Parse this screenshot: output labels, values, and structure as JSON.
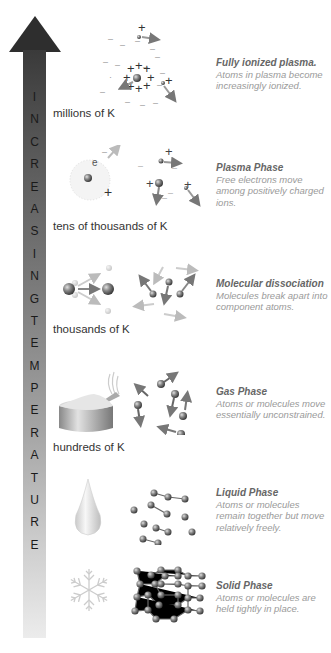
{
  "arrow": {
    "label_letters": [
      "I",
      "N",
      "C",
      "R",
      "E",
      "A",
      "S",
      "I",
      "N",
      "G",
      "T",
      "E",
      "M",
      "P",
      "E",
      "R",
      "A",
      "T",
      "U",
      "R",
      "E"
    ],
    "label": "INCREASING TEMPERATURE",
    "color_top": "#2e2e2e",
    "color_bottom": "#ececec"
  },
  "phases": [
    {
      "name": "fully-ionized-plasma",
      "temperature": "millions of K",
      "title": "Fully ionized plasma.",
      "description": "Atoms in plasma become increasingly ionized."
    },
    {
      "name": "plasma-phase",
      "temperature": "tens of thousands of K",
      "title": "Plasma Phase",
      "description": "Free electrons move among positively charged ions.",
      "electron_label": "e"
    },
    {
      "name": "molecular-dissociation",
      "temperature": "thousands of K",
      "title": "Molecular dissociation",
      "description": "Molecules break apart into component atoms."
    },
    {
      "name": "gas-phase",
      "temperature": "hundreds of K",
      "title": "Gas Phase",
      "description": "Atoms or molecules move essentially unconstrained."
    },
    {
      "name": "liquid-phase",
      "temperature": "",
      "title": "Liquid Phase",
      "description": "Atoms or molecules remain together but move relatively freely."
    },
    {
      "name": "solid-phase",
      "temperature": "",
      "title": "Solid Phase",
      "description": "Atoms or molecules are held tightly in place."
    }
  ]
}
